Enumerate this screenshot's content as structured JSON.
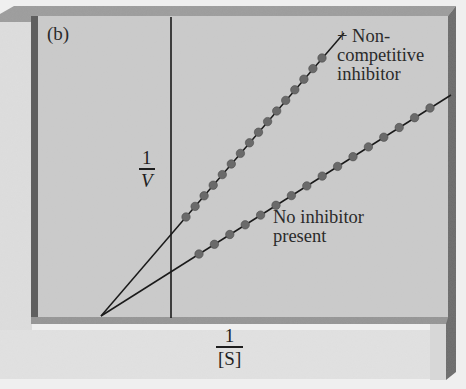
{
  "panel": {
    "label": "(b)",
    "colors": {
      "backdrop": "#ececec",
      "panel_fill": "#cdcdcd",
      "frame_dark": "#5e5e5e",
      "frame_mid": "#8e8e8e",
      "line": "#1a1a1a",
      "dot": "#6a6a6a"
    }
  },
  "axes": {
    "y_label_num": "1",
    "y_label_den": "V",
    "x_label_num": "1",
    "x_label_den": "[S]"
  },
  "legend": {
    "inhibitor_line1": "+ Non-",
    "inhibitor_line2": "competitive",
    "inhibitor_line3": "inhibitor",
    "no_inhibitor_line1": "No inhibitor",
    "no_inhibitor_line2": "present"
  },
  "chart_data": {
    "type": "line",
    "title": "(b)",
    "subtitle": "Lineweaver–Burk plot, noncompetitive inhibition",
    "xlabel": "1/[S]",
    "ylabel": "1/V",
    "grid": false,
    "legend_position": "inline labels at right",
    "x_intercept_shared": -1.0,
    "note": "Both lines share the same x-intercept (-1/Km); the inhibitor line has a steeper slope and higher y-intercept (1/Vmax increased).",
    "xlim": [
      -1.0,
      4.0
    ],
    "ylim": [
      0,
      4.0
    ],
    "series": [
      {
        "name": "+ Noncompetitive inhibitor",
        "y_intercept": 1.3,
        "slope": 1.3,
        "points_count": 16,
        "x": [
          0.2,
          0.4,
          0.6,
          0.8,
          1.0,
          1.2,
          1.4,
          1.6,
          1.8,
          2.0,
          2.2,
          2.4,
          2.6,
          2.8,
          3.0,
          3.2
        ],
        "y": [
          1.56,
          1.82,
          2.08,
          2.34,
          2.6,
          2.86,
          3.12,
          3.38,
          3.64,
          3.9,
          4.16,
          4.42,
          4.68,
          4.94,
          5.2,
          5.46
        ]
      },
      {
        "name": "No inhibitor present",
        "y_intercept": 0.65,
        "slope": 0.65,
        "points_count": 16,
        "x": [
          0.2,
          0.5,
          0.8,
          1.1,
          1.4,
          1.7,
          2.0,
          2.3,
          2.6,
          2.9,
          3.2,
          3.5,
          3.8,
          4.1,
          4.4,
          4.6
        ],
        "y": [
          0.78,
          0.98,
          1.17,
          1.37,
          1.56,
          1.76,
          1.95,
          2.15,
          2.34,
          2.54,
          2.73,
          2.93,
          3.12,
          3.32,
          3.51,
          3.64
        ]
      }
    ]
  }
}
